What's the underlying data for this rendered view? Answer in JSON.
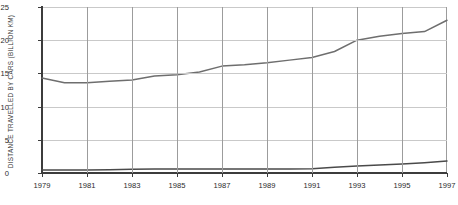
{
  "chart_data": {
    "type": "line",
    "title": "",
    "xlabel": "",
    "ylabel": "DISTANCE TRAVELLED BY CARS (BILLION KM)",
    "x": [
      1979,
      1980,
      1981,
      1982,
      1983,
      1984,
      1985,
      1986,
      1987,
      1988,
      1989,
      1990,
      1991,
      1992,
      1993,
      1994,
      1995,
      1996,
      1997
    ],
    "xlim": [
      1979,
      1997
    ],
    "ylim": [
      0,
      25
    ],
    "ytick_labels": [
      "0",
      "5",
      "10",
      "15",
      "20",
      "25"
    ],
    "ytick_values": [
      0,
      5,
      10,
      15,
      20,
      25
    ],
    "xtick_labels": [
      "1979",
      "1981",
      "1983",
      "1985",
      "1987",
      "1989",
      "1991",
      "1993",
      "1995",
      "1997"
    ],
    "xtick_values": [
      1979,
      1981,
      1983,
      1985,
      1987,
      1989,
      1991,
      1993,
      1995,
      1997
    ],
    "grid": true,
    "legend": "none",
    "series": [
      {
        "name": "Cars",
        "color": "#6e6e6e",
        "values": [
          14.3,
          13.6,
          13.6,
          13.8,
          14.0,
          14.6,
          14.8,
          15.2,
          16.1,
          16.3,
          16.6,
          17.0,
          17.4,
          18.3,
          20.0,
          20.6,
          21.0,
          21.3,
          23.0
        ]
      },
      {
        "name": "Other",
        "color": "#4a4a4a",
        "values": [
          0.45,
          0.45,
          0.45,
          0.5,
          0.55,
          0.6,
          0.6,
          0.6,
          0.6,
          0.6,
          0.6,
          0.6,
          0.65,
          0.85,
          1.05,
          1.2,
          1.35,
          1.55,
          1.8
        ]
      }
    ],
    "series2_end_label": "1.8",
    "series1_end_value": "24.7"
  }
}
